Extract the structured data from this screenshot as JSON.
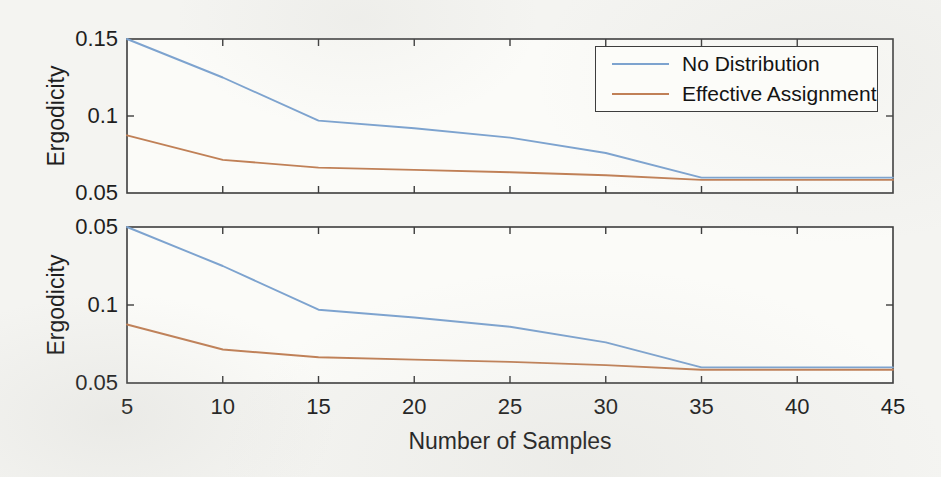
{
  "page": {
    "background": "#f4f4f1",
    "plot_background": "#fbfbf8",
    "axis_color": "#3d3d3d",
    "text_color": "#1e1e1e"
  },
  "chart_data": [
    {
      "type": "line",
      "position": "top",
      "xlabel": "",
      "ylabel": "Ergodicity",
      "xlim": [
        5,
        45
      ],
      "ylim": [
        0.05,
        0.15
      ],
      "xticks": [
        5,
        10,
        15,
        20,
        25,
        30,
        35,
        40,
        45
      ],
      "xtick_labels": [
        "5",
        "10",
        "15",
        "20",
        "25",
        "30",
        "35",
        "40",
        "45"
      ],
      "show_xtick_labels": false,
      "yticks": [
        0.05,
        0.1,
        0.15
      ],
      "ytick_labels": [
        "0.05",
        "0.1",
        "0.15"
      ],
      "grid": false,
      "legend": {
        "visible": true,
        "position": "northeast"
      },
      "x": [
        5,
        10,
        15,
        20,
        25,
        30,
        35,
        40,
        45
      ],
      "series": [
        {
          "name": "No Distribution",
          "color": "#7da3cf",
          "values": [
            0.15,
            0.125,
            0.097,
            0.092,
            0.086,
            0.076,
            0.06,
            0.06,
            0.06
          ]
        },
        {
          "name": "Effective Assignment",
          "color": "#c08057",
          "values": [
            0.0875,
            0.0715,
            0.0665,
            0.065,
            0.0635,
            0.0615,
            0.0585,
            0.0585,
            0.0585
          ]
        }
      ]
    },
    {
      "type": "line",
      "position": "bottom",
      "xlabel": "Number of Samples",
      "ylabel": "Ergodicity",
      "xlim": [
        5,
        45
      ],
      "ylim": [
        0.05,
        0.15
      ],
      "xticks": [
        5,
        10,
        15,
        20,
        25,
        30,
        35,
        40,
        45
      ],
      "xtick_labels": [
        "5",
        "10",
        "15",
        "20",
        "25",
        "30",
        "35",
        "40",
        "45"
      ],
      "show_xtick_labels": true,
      "yticks": [
        0.05,
        0.1,
        0.15
      ],
      "ytick_labels": [
        "0.05",
        "0.1",
        "0.05"
      ],
      "grid": false,
      "legend": {
        "visible": false,
        "position": "none"
      },
      "x": [
        5,
        10,
        15,
        20,
        25,
        30,
        35,
        40,
        45
      ],
      "series": [
        {
          "name": "No Distribution",
          "color": "#7da3cf",
          "values": [
            0.15,
            0.125,
            0.097,
            0.092,
            0.086,
            0.076,
            0.06,
            0.06,
            0.06
          ]
        },
        {
          "name": "Effective Assignment",
          "color": "#c08057",
          "values": [
            0.0875,
            0.0715,
            0.0665,
            0.065,
            0.0635,
            0.0615,
            0.0585,
            0.0585,
            0.0585
          ]
        }
      ]
    }
  ]
}
